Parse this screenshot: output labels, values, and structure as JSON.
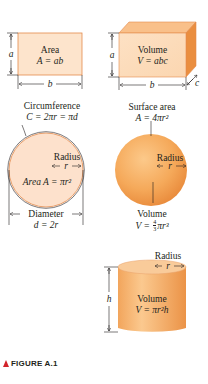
{
  "figure": {
    "caption": "FIGURE A.1",
    "caption_marker_color": "#d2232a",
    "fill_light": "#fde4cc",
    "fill_orange": "#f7b267",
    "fill_dark": "#e8893a",
    "stroke": "#e38a4b"
  },
  "rectangle": {
    "title": "Area",
    "formula": "A = ab",
    "side_a": "a",
    "side_b": "b"
  },
  "box": {
    "title": "Volume",
    "formula": "V = abc",
    "side_a": "a",
    "side_b": "b",
    "side_c": "c"
  },
  "circle": {
    "circumference_label": "Circumference",
    "circumference_formula": "C = 2πr = πd",
    "radius_label": "Radius",
    "radius_symbol": "r",
    "area_formula": "Area A = πr²",
    "diameter_label": "Diameter",
    "diameter_formula": "d = 2r"
  },
  "sphere": {
    "surface_label": "Surface area",
    "surface_formula": "A = 4πr²",
    "radius_label": "Radius",
    "radius_symbol": "r",
    "volume_label": "Volume",
    "volume_formula_prefix": "V = ",
    "volume_frac_num": "4",
    "volume_frac_den": "3",
    "volume_formula_suffix": "πr³"
  },
  "cylinder": {
    "radius_label": "Radius",
    "radius_symbol": "r",
    "height_symbol": "h",
    "volume_label": "Volume",
    "volume_formula": "V = πr²h"
  }
}
